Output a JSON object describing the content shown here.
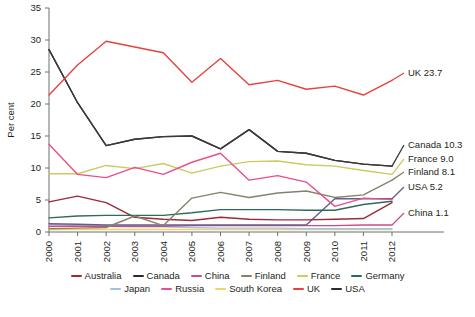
{
  "chart_data": {
    "type": "line",
    "title": "",
    "xlabel": "",
    "ylabel": "Per cent",
    "x": [
      2000,
      2001,
      2002,
      2003,
      2004,
      2005,
      2006,
      2007,
      2008,
      2009,
      2010,
      2011,
      2012
    ],
    "xticklabels": [
      "2000",
      "2001",
      "2002",
      "2003",
      "2004",
      "2005",
      "2006",
      "2007",
      "2008",
      "2009",
      "2010",
      "2011",
      "2012"
    ],
    "yticklabels": [
      "0",
      "5",
      "10",
      "15",
      "20",
      "25",
      "30",
      "35"
    ],
    "yticks": [
      0,
      5,
      10,
      15,
      20,
      25,
      30,
      35
    ],
    "ylim": [
      0,
      35
    ],
    "xlim": [
      2000,
      2012
    ],
    "grid": false,
    "legend_position": "bottom",
    "series": [
      {
        "name": "UK",
        "color": "#e8413c",
        "values": [
          21.4,
          26.1,
          29.8,
          28.9,
          28.0,
          23.4,
          27.1,
          23.0,
          23.7,
          22.3,
          22.8,
          21.4,
          23.7
        ],
        "end_label": "UK 23.7"
      },
      {
        "name": "USA",
        "color": "#2b2b2b",
        "values": [
          28.5,
          20.2,
          13.5,
          14.5,
          14.9,
          15.0,
          13.0,
          16.0,
          12.6,
          12.3,
          11.2,
          10.6,
          10.3
        ],
        "end_label": null
      },
      {
        "name": "Canada",
        "color": "#3a3a3a",
        "values": [
          28.5,
          20.2,
          13.5,
          14.5,
          14.9,
          15.0,
          13.0,
          16.0,
          12.6,
          12.3,
          11.2,
          10.6,
          10.3
        ],
        "end_label": "Canada 10.3"
      },
      {
        "name": "France",
        "color": "#c9cc5e",
        "values": [
          9.1,
          9.1,
          10.4,
          9.9,
          10.7,
          9.2,
          10.3,
          11.0,
          11.1,
          10.5,
          10.3,
          9.6,
          9.0
        ],
        "end_label": "France 9.0"
      },
      {
        "name": "Finland",
        "color": "#84836a",
        "values": [
          0.5,
          0.6,
          0.7,
          2.5,
          1.0,
          5.3,
          6.2,
          5.4,
          6.1,
          6.4,
          5.4,
          5.8,
          8.1
        ],
        "end_label": "Finland 8.1"
      },
      {
        "name": "Russia",
        "color": "#e7508c",
        "values": [
          13.7,
          9.0,
          8.5,
          10.1,
          9.0,
          10.9,
          12.3,
          8.1,
          8.8,
          7.8,
          4.0,
          5.3,
          5.1
        ],
        "end_label": null
      },
      {
        "name": "Germany",
        "color": "#2e6b57",
        "values": [
          2.2,
          2.5,
          2.6,
          2.6,
          2.6,
          3.0,
          3.5,
          3.5,
          3.5,
          3.4,
          3.4,
          4.3,
          4.8
        ],
        "end_label": null
      },
      {
        "name": "Australia",
        "color": "#9e2a38",
        "values": [
          4.7,
          5.6,
          4.6,
          2.3,
          2.0,
          1.8,
          2.3,
          2.0,
          1.9,
          1.9,
          2.0,
          2.1,
          4.6
        ],
        "end_label": null
      },
      {
        "name": "USA-flat",
        "color": "#6b5b8c",
        "values": [
          1.3,
          1.2,
          1.1,
          1.1,
          1.1,
          1.1,
          1.1,
          1.1,
          1.1,
          1.1,
          5.2,
          5.2,
          5.2
        ],
        "end_label": "USA 5.2"
      },
      {
        "name": "China",
        "color": "#cf4b86",
        "values": [
          0.9,
          0.9,
          0.9,
          0.9,
          0.9,
          1.0,
          1.0,
          1.0,
          1.0,
          1.0,
          1.0,
          1.1,
          1.1
        ],
        "end_label": "China 1.1"
      },
      {
        "name": "Japan",
        "color": "#9fc2e8",
        "values": [
          1.2,
          1.0,
          0.9,
          0.8,
          0.8,
          0.7,
          0.6,
          0.6,
          0.6,
          0.5,
          0.5,
          0.5,
          0.5
        ],
        "end_label": null
      },
      {
        "name": "South Korea",
        "color": "#f0d46a",
        "values": [
          0.4,
          0.4,
          0.4,
          0.4,
          0.4,
          0.4,
          0.4,
          0.4,
          0.4,
          0.4,
          0.4,
          0.4,
          0.4
        ],
        "end_label": null
      }
    ],
    "end_labels": [
      {
        "text": "UK 23.7",
        "value": 23.7,
        "color": "#e8413c"
      },
      {
        "text": "Canada 10.3",
        "value": 10.3,
        "color": "#3a3a3a"
      },
      {
        "text": "France 9.0",
        "value": 9.0,
        "color": "#c9cc5e"
      },
      {
        "text": "Finland 8.1",
        "value": 8.1,
        "color": "#84836a"
      },
      {
        "text": "USA 5.2",
        "value": 5.2,
        "color": "#6b5b8c"
      },
      {
        "text": "China 1.1",
        "value": 1.1,
        "color": "#cf4b86"
      }
    ],
    "legend": [
      {
        "label": "Australia",
        "color": "#9e2a38"
      },
      {
        "label": "Canada",
        "color": "#2b2b2b"
      },
      {
        "label": "China",
        "color": "#cf4b86"
      },
      {
        "label": "Finland",
        "color": "#84836a"
      },
      {
        "label": "France",
        "color": "#c9cc5e"
      },
      {
        "label": "Germany",
        "color": "#2e6b57"
      },
      {
        "label": "Japan",
        "color": "#9fc2e8"
      },
      {
        "label": "Russia",
        "color": "#e7508c"
      },
      {
        "label": "South Korea",
        "color": "#f0d46a"
      },
      {
        "label": "UK",
        "color": "#e8413c"
      },
      {
        "label": "USA",
        "color": "#2b2b2b"
      }
    ],
    "legend_rows": [
      [
        "Australia",
        "Canada",
        "China",
        "Finland",
        "France",
        "Germany"
      ],
      [
        "Japan",
        "Russia",
        "South Korea",
        "UK",
        "USA"
      ]
    ]
  },
  "axis": {
    "ylabel": "Per cent"
  },
  "footnote": {
    "text": ""
  }
}
